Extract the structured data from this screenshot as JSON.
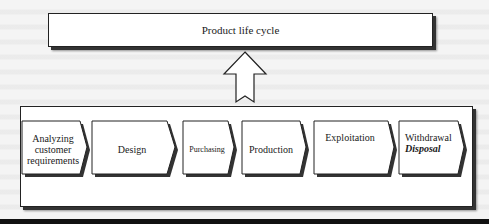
{
  "diagram": {
    "title": "Product life cycle",
    "arrow": "up-arrow",
    "steps": [
      {
        "label": "Analyzing customer requirements",
        "lines": [
          "Analyzing",
          "customer",
          "requirements"
        ]
      },
      {
        "label": "Design",
        "lines": [
          "Design"
        ]
      },
      {
        "label": "Purchasing",
        "lines": [
          "Purchasing"
        ]
      },
      {
        "label": "Production",
        "lines": [
          "Production"
        ]
      },
      {
        "label": "Exploitation",
        "lines": [
          "Exploitation"
        ]
      },
      {
        "label": "Withdrawal Disposal",
        "lines": [
          "Withdrawal"
        ],
        "emphasis": "Disposal"
      }
    ],
    "colors": {
      "border": "#222222",
      "shadow": "#333333",
      "fill": "#ffffff",
      "background": "#f4f4f4"
    }
  }
}
